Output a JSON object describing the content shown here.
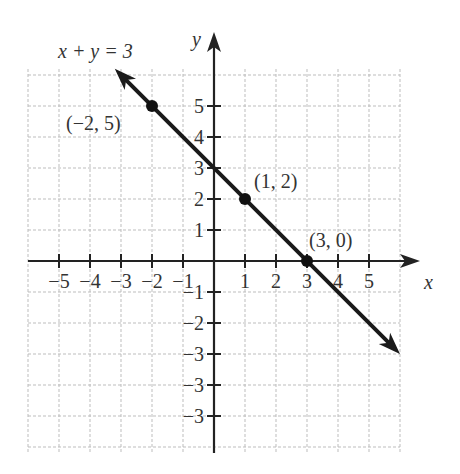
{
  "chart_data": {
    "type": "line",
    "title": "x + y = 3",
    "xlabel": "x",
    "ylabel": "y",
    "xlim": [
      -6,
      6
    ],
    "ylim": [
      -6,
      6
    ],
    "grid": true,
    "x_tick_labels": [
      "−5",
      "−4",
      "−3",
      "−2",
      "−1",
      "1",
      "2",
      "3",
      "4",
      "5"
    ],
    "y_tick_labels": [
      "5",
      "4",
      "3",
      "2",
      "1",
      "−1",
      "−2",
      "−3",
      "−3",
      "−3"
    ],
    "series": [
      {
        "name": "x + y = 3",
        "x": [
          -3.2,
          6
        ],
        "y": [
          6.2,
          -3
        ],
        "arrows": "both"
      }
    ],
    "points": [
      {
        "x": -2,
        "y": 5,
        "label": "(−2, 5)"
      },
      {
        "x": 1,
        "y": 2,
        "label": "(1, 2)"
      },
      {
        "x": 3,
        "y": 0,
        "label": "(3, 0)"
      }
    ],
    "annotations": [
      "x + y = 3",
      "(−2, 5)",
      "(1, 2)",
      "(3, 0)"
    ]
  },
  "labels": {
    "equation": "x + y = 3",
    "x_axis": "x",
    "y_axis": "y",
    "p1": "(−2, 5)",
    "p2": "(1, 2)",
    "p3": "(3, 0)"
  }
}
